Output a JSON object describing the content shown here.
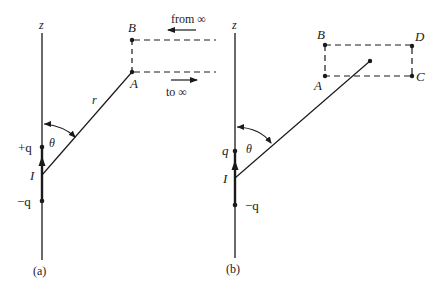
{
  "figure": {
    "panel_a": {
      "caption": "(a)",
      "axis_label": "z",
      "charge_plus": "+q",
      "charge_minus": "−q",
      "current_label": "I",
      "angle_label": "θ",
      "radius_label": "r",
      "point_a": "A",
      "point_b": "B",
      "from_inf": "from ∞",
      "to_inf": "to ∞"
    },
    "panel_b": {
      "caption": "(b)",
      "axis_label": "z",
      "charge_plus": "q",
      "charge_minus": "−q",
      "current_label": "I",
      "angle_label": "θ",
      "point_a": "A",
      "point_b": "B",
      "point_c": "C",
      "point_d": "D"
    },
    "colors": {
      "ink": "#1a1a1a",
      "background": "#ffffff"
    }
  }
}
